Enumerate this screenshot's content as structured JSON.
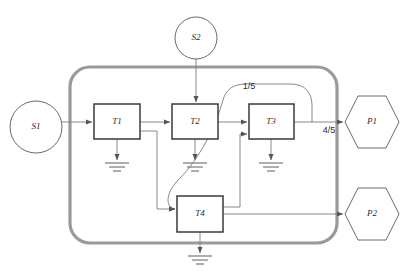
{
  "diagram": {
    "colors": {
      "background": "#ffffff",
      "container_border": "#9a9a9a",
      "box_border": "#3a3a3a",
      "wire": "#7a7a7a",
      "shape_border": "#595959",
      "text": "#2b2b2b"
    },
    "sources": [
      {
        "id": "S1",
        "label": "S1",
        "shape": "circle",
        "cx": 36,
        "cy": 127,
        "r": 26
      },
      {
        "id": "S2",
        "label": "S2",
        "shape": "circle",
        "cx": 196,
        "cy": 38,
        "r": 21
      }
    ],
    "transforms": [
      {
        "id": "T1",
        "label": "T1",
        "shape": "rect",
        "x": 94,
        "y": 104,
        "w": 46,
        "h": 35
      },
      {
        "id": "T2",
        "label": "T2",
        "shape": "rect",
        "x": 172,
        "y": 104,
        "w": 46,
        "h": 35
      },
      {
        "id": "T3",
        "label": "T3",
        "shape": "rect",
        "x": 249,
        "y": 104,
        "w": 45,
        "h": 35
      },
      {
        "id": "T4",
        "label": "T4",
        "shape": "rect",
        "x": 177,
        "y": 196,
        "w": 46,
        "h": 36
      }
    ],
    "products": [
      {
        "id": "P1",
        "label": "P1",
        "shape": "hexagon",
        "cx": 372,
        "cy": 122,
        "rx": 27,
        "ry": 26
      },
      {
        "id": "P2",
        "label": "P2",
        "shape": "hexagon",
        "cx": 372,
        "cy": 214,
        "rx": 27,
        "ry": 26
      }
    ],
    "edge_labels": [
      {
        "id": "split-one-fifth",
        "label": "1/5",
        "x": 249,
        "y": 87
      },
      {
        "id": "split-four-fifths",
        "label": "4/5",
        "x": 329,
        "y": 131
      }
    ],
    "grounds": [
      {
        "id": "ground-t1",
        "x": 117,
        "y": 163
      },
      {
        "id": "ground-t2",
        "x": 195,
        "y": 163
      },
      {
        "id": "ground-t3",
        "x": 271,
        "y": 163
      },
      {
        "id": "ground-t4",
        "x": 200,
        "y": 256
      }
    ],
    "container": {
      "x": 70,
      "y": 67,
      "w": 267,
      "h": 176,
      "r": 20
    }
  }
}
